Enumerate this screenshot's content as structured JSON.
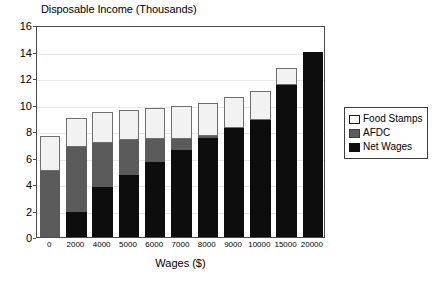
{
  "chart_data": {
    "type": "bar",
    "subtype": "stacked-bar",
    "title": "Disposable Income (Thousands)",
    "xlabel": "Wages ($)",
    "ylabel": "",
    "categories": [
      "0",
      "2000",
      "4000",
      "5000",
      "6000",
      "7000",
      "8000",
      "9000",
      "10000",
      "15000",
      "20000"
    ],
    "ylim": [
      0,
      16
    ],
    "yticks": [
      0,
      2,
      4,
      6,
      8,
      10,
      12,
      14,
      16
    ],
    "ytick_labels": [
      "0",
      "2",
      "4",
      "6",
      "8",
      "10",
      "12",
      "14",
      "16"
    ],
    "grid": true,
    "legend_position": "right",
    "series": [
      {
        "name": "Net Wages",
        "color": "#0d0d0d",
        "values": [
          0,
          1.9,
          3.8,
          4.7,
          5.65,
          6.6,
          7.5,
          8.25,
          8.85,
          11.45,
          14.0
        ]
      },
      {
        "name": "AFDC",
        "color": "#5b5b5b",
        "values": [
          5.0,
          4.9,
          3.3,
          2.6,
          1.75,
          0.8,
          0.1,
          0,
          0,
          0,
          0
        ]
      },
      {
        "name": "Food Stamps",
        "color": "#f2f2f2",
        "values": [
          2.6,
          2.2,
          2.3,
          2.3,
          2.35,
          2.5,
          2.5,
          2.35,
          2.2,
          1.3,
          0
        ]
      }
    ],
    "totals": [
      7.6,
      9.0,
      9.4,
      9.6,
      9.75,
      9.9,
      10.1,
      10.6,
      11.05,
      12.75,
      14.0
    ],
    "stack_order_bottom_to_top": [
      "Net Wages",
      "AFDC",
      "Food Stamps"
    ]
  },
  "legend": {
    "entries": [
      {
        "label": "Food Stamps",
        "swatch": "white-square-swatch"
      },
      {
        "label": "AFDC",
        "swatch": "gray-square-swatch"
      },
      {
        "label": "Net Wages",
        "swatch": "black-square-swatch"
      }
    ]
  },
  "colors": {
    "net_wages": "#0d0d0d",
    "afdc": "#5b5b5b",
    "food_stamps": "#f2f2f2",
    "axis": "#4a4a4a",
    "gridline": "#e8e8e8",
    "background": "#ffffff"
  }
}
